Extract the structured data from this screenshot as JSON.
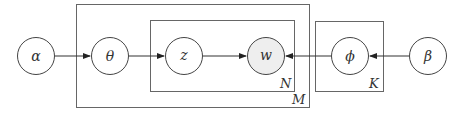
{
  "diagram": {
    "type": "plate-notation",
    "nodes": [
      {
        "id": "alpha",
        "label": "α",
        "cx": 36,
        "cy": 56,
        "observed": false
      },
      {
        "id": "theta",
        "label": "θ",
        "cx": 110,
        "cy": 56,
        "observed": false
      },
      {
        "id": "z",
        "label": "z",
        "cx": 184,
        "cy": 56,
        "observed": false
      },
      {
        "id": "w",
        "label": "w",
        "cx": 266,
        "cy": 56,
        "observed": true
      },
      {
        "id": "phi",
        "label": "ϕ",
        "cx": 350,
        "cy": 56,
        "observed": false
      },
      {
        "id": "beta",
        "label": "β",
        "cx": 428,
        "cy": 56,
        "observed": false
      }
    ],
    "edges": [
      {
        "from": "alpha",
        "to": "theta"
      },
      {
        "from": "theta",
        "to": "z"
      },
      {
        "from": "z",
        "to": "w"
      },
      {
        "from": "phi",
        "to": "w"
      },
      {
        "from": "beta",
        "to": "phi"
      }
    ],
    "plates": [
      {
        "id": "M",
        "label": "M",
        "x": 76,
        "y": 4,
        "w": 233,
        "h": 103
      },
      {
        "id": "N",
        "label": "N",
        "x": 150,
        "y": 20,
        "w": 144,
        "h": 71
      },
      {
        "id": "K",
        "label": "K",
        "x": 315,
        "y": 21,
        "w": 68,
        "h": 70
      }
    ],
    "colors": {
      "stroke": "#444444",
      "observed_fill": "#eeeeee",
      "plate_stroke": "#666666"
    }
  }
}
